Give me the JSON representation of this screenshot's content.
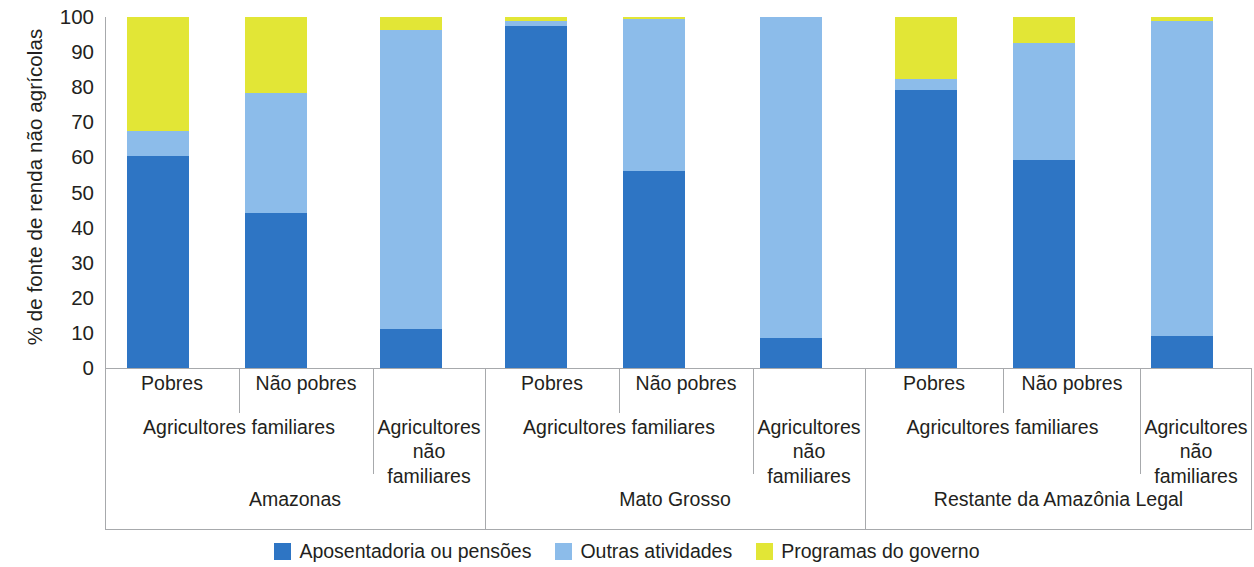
{
  "chart_data": {
    "type": "bar",
    "stacked": true,
    "title": "",
    "subtitle": "",
    "xlabel": "",
    "ylabel": "% de fonte de renda não agrícolas",
    "ylim": [
      0,
      100
    ],
    "ytick_labels": [
      "0",
      "10",
      "20",
      "30",
      "40",
      "50",
      "60",
      "70",
      "80",
      "90",
      "100"
    ],
    "ytick_values": [
      0,
      10,
      20,
      30,
      40,
      50,
      60,
      70,
      80,
      90,
      100
    ],
    "grid": false,
    "legend_position": "bottom",
    "categories": [
      "Amazonas / Agricultores familiares / Pobres",
      "Amazonas / Agricultores familiares / Não pobres",
      "Amazonas / Agricultores não familiares",
      "Mato Grosso / Agricultores familiares / Pobres",
      "Mato Grosso / Agricultores familiares / Não pobres",
      "Mato Grosso / Agricultores não familiares",
      "Restante da Amazônia Legal / Agricultores familiares / Pobres",
      "Restante da Amazônia Legal / Agricultores familiares / Não pobres",
      "Restante da Amazônia Legal / Agricultores não familiares"
    ],
    "series": [
      {
        "name": "Aposentadoria ou pensões",
        "color": "#2E75C4",
        "values": [
          60.5,
          44.3,
          11.2,
          97.3,
          56.2,
          8.6,
          79.2,
          59.4,
          9.2
        ]
      },
      {
        "name": "Outras atividades",
        "color": "#8CBCEA",
        "values": [
          7.0,
          34.0,
          85.0,
          1.7,
          43.3,
          91.4,
          3.2,
          33.1,
          89.6
        ]
      },
      {
        "name": "Programas do governo",
        "color": "#E2E636",
        "values": [
          32.5,
          21.7,
          3.8,
          1.0,
          0.5,
          0.0,
          17.6,
          7.5,
          1.2
        ]
      }
    ]
  },
  "axis": {
    "y_title": "% de fonte de renda não agrícolas"
  },
  "groups": [
    {
      "region": "Amazonas",
      "familiar_label": "Agricultores familiares",
      "nonfamiliar_label_line1": "Agricultores",
      "nonfamiliar_label_line2": "não familiares",
      "poor_label": "Pobres",
      "nonpoor_label": "Não pobres"
    },
    {
      "region": "Mato Grosso",
      "familiar_label": "Agricultores familiares",
      "nonfamiliar_label_line1": "Agricultores",
      "nonfamiliar_label_line2": "não familiares",
      "poor_label": "Pobres",
      "nonpoor_label": "Não pobres"
    },
    {
      "region": "Restante da Amazônia Legal",
      "familiar_label": "Agricultores familiares",
      "nonfamiliar_label_line1": "Agricultores",
      "nonfamiliar_label_line2": "não familiares",
      "poor_label": "Pobres",
      "nonpoor_label": "Não pobres"
    }
  ],
  "legend": {
    "items": [
      {
        "label": "Aposentadoria ou pensões",
        "color": "#2E75C4"
      },
      {
        "label": "Outras atividades",
        "color": "#8CBCEA"
      },
      {
        "label": "Programas do governo",
        "color": "#E2E636"
      }
    ]
  },
  "colors": {
    "dark_blue": "#2E75C4",
    "light_blue": "#8CBCEA",
    "yellow": "#E2E636",
    "axis": "#a7a9ac",
    "text": "#231f20"
  }
}
